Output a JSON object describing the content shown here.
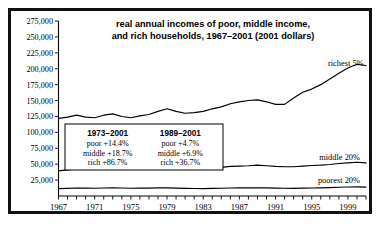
{
  "chart_data": {
    "type": "line",
    "title": "real annual incomes of poor, middle income,",
    "subtitle": "and rich households, 1967–2001 (2001 dollars)",
    "xlabel": "",
    "ylabel": "",
    "grid": false,
    "legend_position": "inline-right",
    "xlim": [
      1967,
      2001
    ],
    "ylim": [
      0,
      275000
    ],
    "ytick_values": [
      25000,
      50000,
      75000,
      100000,
      125000,
      150000,
      175000,
      200000,
      225000,
      250000,
      275000
    ],
    "ytick_labels": [
      "25,000",
      "50,000",
      "75,000",
      "100,000",
      "125,000",
      "150,000",
      "175,000",
      "200,000",
      "225,000",
      "250,000",
      "275,000"
    ],
    "xtick_labels": [
      "1967",
      "1971",
      "1975",
      "1979",
      "1983",
      "1987",
      "1991",
      "1995",
      "1999"
    ],
    "xtick_values": [
      1967,
      1971,
      1975,
      1979,
      1983,
      1987,
      1991,
      1995,
      1999
    ],
    "x": [
      1967,
      1968,
      1969,
      1970,
      1971,
      1972,
      1973,
      1974,
      1975,
      1976,
      1977,
      1978,
      1979,
      1980,
      1981,
      1982,
      1983,
      1984,
      1985,
      1986,
      1987,
      1988,
      1989,
      1990,
      1991,
      1992,
      1993,
      1994,
      1995,
      1996,
      1997,
      1998,
      1999,
      2000,
      2001
    ],
    "series": [
      {
        "name": "richest 5%",
        "label": "richest 5%",
        "values": [
          122000,
          124000,
          127000,
          124000,
          123000,
          127000,
          129000,
          125000,
          123000,
          126000,
          128000,
          133000,
          137000,
          133000,
          130000,
          131000,
          133000,
          137000,
          140000,
          145000,
          148000,
          150000,
          151000,
          148000,
          144000,
          144000,
          154000,
          163000,
          168000,
          175000,
          184000,
          193000,
          201000,
          207000,
          205000
        ]
      },
      {
        "name": "middle 20%",
        "label": "middle 20%",
        "values": [
          39500,
          41000,
          42500,
          42000,
          42000,
          43500,
          44500,
          43500,
          42500,
          43500,
          44000,
          45000,
          45500,
          44000,
          43500,
          43000,
          43000,
          44000,
          45000,
          46500,
          47000,
          47500,
          48500,
          47500,
          46500,
          46000,
          46000,
          47000,
          48000,
          48500,
          49500,
          51000,
          52000,
          53000,
          52000
        ]
      },
      {
        "name": "poorest 20%",
        "label": "poorest 20%",
        "values": [
          11500,
          12000,
          12500,
          12300,
          12200,
          12600,
          12900,
          12500,
          12100,
          12300,
          12400,
          12700,
          12800,
          12300,
          11900,
          11700,
          11600,
          11900,
          12100,
          12500,
          12700,
          12800,
          13000,
          12700,
          12300,
          12100,
          12000,
          12300,
          12600,
          12800,
          13200,
          13700,
          14100,
          14400,
          14000
        ]
      }
    ],
    "annotations": [
      {
        "heading": "1973–2001",
        "lines": [
          "poor +14.4%",
          "middle +18.7%",
          "rich +86.7%"
        ]
      },
      {
        "heading": "1989–2001",
        "lines": [
          "poor +4.7%",
          "middle +6.9%",
          "rich +36.7%"
        ]
      }
    ]
  }
}
